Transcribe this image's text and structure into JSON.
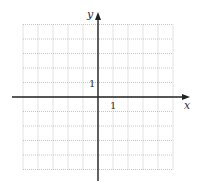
{
  "diagram": {
    "type": "coordinate-plane",
    "x_axis": {
      "label": "x",
      "tick_label": "1"
    },
    "y_axis": {
      "label": "y",
      "tick_label": "1"
    },
    "grid": {
      "range_x": [
        -5,
        5
      ],
      "range_y": [
        -5,
        5
      ],
      "style": "dotted"
    },
    "colors": {
      "axis": "#222222",
      "grid": "#b8b8b8",
      "background": "#ffffff"
    }
  }
}
